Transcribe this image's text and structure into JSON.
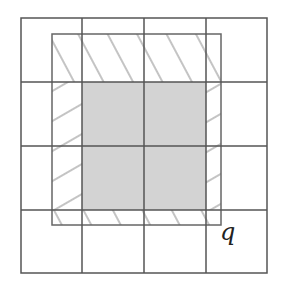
{
  "diagram": {
    "label": "q",
    "grid": {
      "cols": 4,
      "rows": 4,
      "x_lines": [
        21,
        82,
        144,
        206,
        267
      ],
      "y_lines": [
        18,
        82,
        146,
        210,
        273
      ],
      "line_color": "#555555"
    },
    "outer_hatched_rect": {
      "x": 52,
      "y": 34,
      "w": 169,
      "h": 191,
      "stroke": "#666666",
      "hatch_color": "#c4c4c4"
    },
    "inner_filled_square": {
      "x": 82,
      "y": 82,
      "w": 124,
      "h": 128,
      "fill": "#d3d3d3"
    }
  }
}
